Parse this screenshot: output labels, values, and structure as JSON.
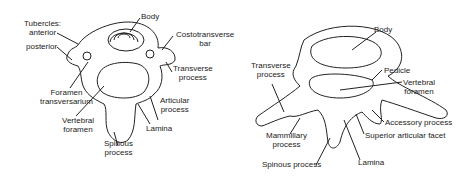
{
  "left_figure": {
    "labels": {
      "tubercles": "Tubercles:",
      "anterior": "anterior",
      "posterior": "posterior",
      "body": "Body",
      "costotransverse_1": "Costotransverse",
      "costotransverse_2": "bar",
      "transverse_1": "Transverse",
      "transverse_2": "process",
      "foramen_1": "Foramen",
      "foramen_2": "transversarium",
      "articular_1": "Articular",
      "articular_2": "process",
      "vertebral_1": "Vertebral",
      "vertebral_2": "foramen",
      "lamina": "Lamina",
      "spinous_1": "Spinous",
      "spinous_2": "process"
    }
  },
  "right_figure": {
    "labels": {
      "body": "Body",
      "transverse_1": "Transverse",
      "transverse_2": "process",
      "pedicle": "Pedicle",
      "vertebral_1": "Vertebral",
      "vertebral_2": "foramen",
      "accessory": "Accessory process",
      "mammillary_1": "Mammillary",
      "mammillary_2": "process",
      "superior_facet": "Superior articular facet",
      "spinous": "Spinous process",
      "lamina": "Lamina"
    }
  }
}
